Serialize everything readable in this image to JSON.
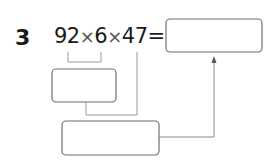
{
  "problem": {
    "number": "3",
    "expression": {
      "a": "92",
      "op1": "×",
      "b": "6",
      "op2": "×",
      "c": "47",
      "equals": "="
    }
  },
  "boxes": [
    {
      "id": "answer-box",
      "value": ""
    },
    {
      "id": "step1-box",
      "value": ""
    },
    {
      "id": "step2-box",
      "value": ""
    }
  ],
  "colors": {
    "box_border": "#6e6e6e",
    "connector": "#9a9a9a",
    "text": "#1a1a1a"
  }
}
